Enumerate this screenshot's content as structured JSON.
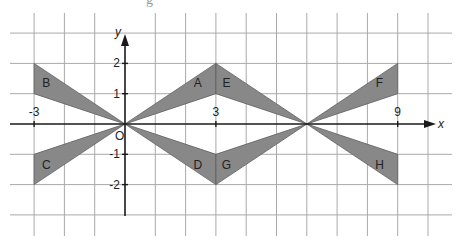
{
  "figure": {
    "type": "coordinate-grid-transformations",
    "origin_px": [
      125,
      124
    ],
    "unit_px": 30.3,
    "grid": {
      "x_range": [
        -3,
        10
      ],
      "y_range": [
        -3,
        3
      ],
      "line_color": "#a9a9a9"
    },
    "axes": {
      "x_label": "x",
      "y_label": "y",
      "origin_label": "O",
      "x_ticks": [
        {
          "value": -3,
          "label": "-3"
        },
        {
          "value": 3,
          "label": "3"
        },
        {
          "value": 9,
          "label": "9"
        }
      ],
      "y_ticks": [
        {
          "value": 2,
          "label": "2"
        },
        {
          "value": 1,
          "label": "1"
        },
        {
          "value": -1,
          "label": "-1"
        },
        {
          "value": -2,
          "label": "-2"
        }
      ]
    },
    "fill_color": "#888888",
    "shapes": [
      {
        "label": "A",
        "vertices": [
          [
            0,
            0
          ],
          [
            3,
            2
          ],
          [
            3,
            1
          ]
        ]
      },
      {
        "label": "B",
        "vertices": [
          [
            0,
            0
          ],
          [
            -3,
            2
          ],
          [
            -3,
            1
          ]
        ]
      },
      {
        "label": "C",
        "vertices": [
          [
            0,
            0
          ],
          [
            -3,
            -1
          ],
          [
            -3,
            -2
          ]
        ]
      },
      {
        "label": "D",
        "vertices": [
          [
            0,
            0
          ],
          [
            3,
            -1
          ],
          [
            3,
            -2
          ]
        ]
      },
      {
        "label": "E",
        "vertices": [
          [
            3,
            2
          ],
          [
            3,
            1
          ],
          [
            6,
            0
          ]
        ]
      },
      {
        "label": "F",
        "vertices": [
          [
            6,
            0
          ],
          [
            9,
            2
          ],
          [
            9,
            1
          ]
        ]
      },
      {
        "label": "G",
        "vertices": [
          [
            3,
            -1
          ],
          [
            3,
            -2
          ],
          [
            6,
            0
          ]
        ]
      },
      {
        "label": "H",
        "vertices": [
          [
            6,
            0
          ],
          [
            9,
            -1
          ],
          [
            9,
            -2
          ]
        ]
      }
    ]
  }
}
